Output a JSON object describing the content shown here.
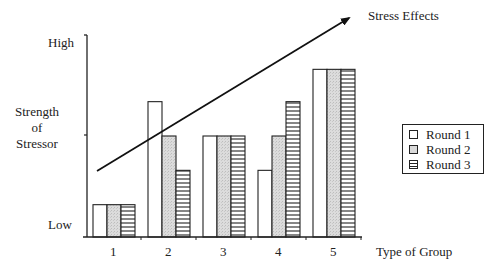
{
  "chart_data": {
    "type": "bar",
    "title": "",
    "xlabel": "Type of Group",
    "ylabel": "Strength of Stressor",
    "y_tick_labels": {
      "top": "High",
      "bottom": "Low"
    },
    "ylim": [
      0,
      100
    ],
    "categories": [
      "1",
      "2",
      "3",
      "4",
      "5"
    ],
    "series": [
      {
        "name": "Round 1",
        "pattern": "white",
        "values": [
          16,
          67,
          50,
          33,
          83
        ]
      },
      {
        "name": "Round 2",
        "pattern": "stippled-gray",
        "values": [
          16,
          50,
          50,
          50,
          83
        ]
      },
      {
        "name": "Round 3",
        "pattern": "horizontal-lines",
        "values": [
          16,
          33,
          50,
          67,
          83
        ]
      }
    ],
    "annotations": [
      {
        "type": "arrow",
        "label": "Stress Effects",
        "from": "lower-left (group 1)",
        "to": "upper-right (beyond group 5)"
      }
    ],
    "legend_position": "right",
    "grid": false
  },
  "labels": {
    "high": "High",
    "low": "Low",
    "ylabel_lines": [
      "Strength",
      "of",
      "Stressor"
    ],
    "xlabel": "Type of Group",
    "arrow_label": "Stress Effects"
  },
  "legend": [
    {
      "label": "Round 1"
    },
    {
      "label": "Round 2"
    },
    {
      "label": "Round 3"
    }
  ],
  "colors": {
    "axis": "#222222",
    "round1_fill": "#ffffff",
    "round2_fill": "#d9d9d9",
    "round3_line": "#222222"
  }
}
